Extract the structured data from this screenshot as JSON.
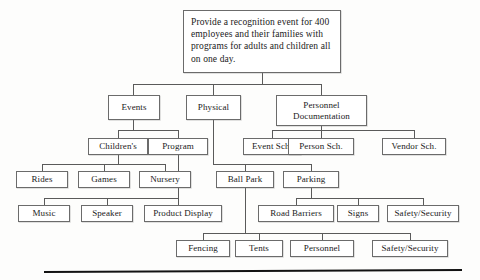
{
  "diagram": {
    "type": "work-breakdown-structure",
    "title_box": {
      "text": "Provide a recognition event for 400 employees and their families with programs for adults and children all on one day."
    },
    "levels": {
      "level2": [
        {
          "id": "events",
          "label": "Events"
        },
        {
          "id": "physical",
          "label": "Physical"
        },
        {
          "id": "personnel-documentation",
          "label": "Personnel Documentation"
        }
      ],
      "level3": [
        {
          "id": "childrens",
          "label": "Children's"
        },
        {
          "id": "program",
          "label": "Program"
        },
        {
          "id": "event-sch",
          "label": "Event Sch."
        },
        {
          "id": "person-sch",
          "label": "Person Sch."
        },
        {
          "id": "vendor-sch",
          "label": "Vendor Sch."
        }
      ],
      "level4": [
        {
          "id": "rides",
          "label": "Rides"
        },
        {
          "id": "games",
          "label": "Games"
        },
        {
          "id": "nursery",
          "label": "Nursery"
        },
        {
          "id": "ball-park",
          "label": "Ball Park"
        },
        {
          "id": "parking",
          "label": "Parking"
        }
      ],
      "level5": [
        {
          "id": "music",
          "label": "Music"
        },
        {
          "id": "speaker",
          "label": "Speaker"
        },
        {
          "id": "product-display",
          "label": "Product Display"
        },
        {
          "id": "road-barriers",
          "label": "Road Barriers"
        },
        {
          "id": "signs",
          "label": "Signs"
        },
        {
          "id": "safety-security-parking",
          "label": "Safety/Security"
        }
      ],
      "level6": [
        {
          "id": "fencing",
          "label": "Fencing"
        },
        {
          "id": "tents",
          "label": "Tents"
        },
        {
          "id": "personnel",
          "label": "Personnel"
        },
        {
          "id": "safety-security-ballpark",
          "label": "Safety/Security"
        }
      ]
    },
    "colors": {
      "box_border": "#6b6b6b",
      "connector": "#5a5a5a",
      "text": "#1a1a1a",
      "baseline_rule": "#121212",
      "page_background": "#fdfdfc"
    }
  }
}
